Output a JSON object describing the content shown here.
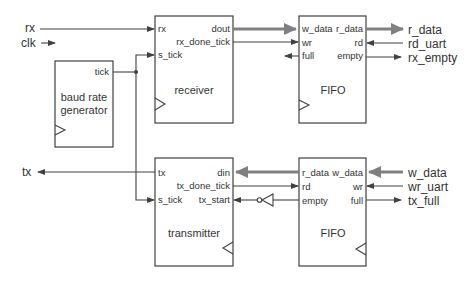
{
  "diagram": {
    "type": "block-diagram",
    "external_inputs": [
      "rx",
      "clk",
      "rd_uart",
      "w_data",
      "wr_uart"
    ],
    "external_outputs": [
      "r_data",
      "rx_empty",
      "tx",
      "tx_full"
    ],
    "blocks": {
      "baud": {
        "name": "baud rate generator",
        "line1": "baud rate",
        "line2": "generator",
        "ports": {
          "tick": "tick"
        }
      },
      "receiver": {
        "name": "receiver",
        "ports": {
          "rx": "rx",
          "s_tick": "s_tick",
          "dout": "dout",
          "rx_done_tick": "rx_done_tick"
        }
      },
      "fifo_rx": {
        "name": "FIFO",
        "ports": {
          "w_data": "w_data",
          "wr": "wr",
          "full": "full",
          "r_data": "r_data",
          "rd": "rd",
          "empty": "empty"
        }
      },
      "transmitter": {
        "name": "transmitter",
        "ports": {
          "tx": "tx",
          "s_tick": "s_tick",
          "din": "din",
          "tx_done_tick": "tx_done_tick",
          "tx_start": "tx_start"
        }
      },
      "fifo_tx": {
        "name": "FIFO",
        "ports": {
          "r_data": "r_data",
          "rd": "rd",
          "empty": "empty",
          "w_data": "w_data",
          "wr": "wr",
          "full": "full"
        }
      }
    },
    "signals": {
      "rx": "rx",
      "clk": "clk",
      "tx": "tx",
      "r_data": "r_data",
      "rd_uart": "rd_uart",
      "rx_empty": "rx_empty",
      "w_data": "w_data",
      "wr_uart": "wr_uart",
      "tx_full": "tx_full"
    },
    "connections": [
      {
        "from": "rx",
        "to": "receiver.rx"
      },
      {
        "from": "baud.tick",
        "to": "receiver.s_tick"
      },
      {
        "from": "baud.tick",
        "to": "transmitter.s_tick"
      },
      {
        "from": "receiver.dout",
        "to": "fifo_rx.w_data",
        "bus": true
      },
      {
        "from": "receiver.rx_done_tick",
        "to": "fifo_rx.wr"
      },
      {
        "from": "fifo_rx.full",
        "to": "(unconnected)"
      },
      {
        "from": "fifo_rx.r_data",
        "to": "r_data",
        "bus": true
      },
      {
        "from": "rd_uart",
        "to": "fifo_rx.rd"
      },
      {
        "from": "fifo_rx.empty",
        "to": "rx_empty"
      },
      {
        "from": "transmitter.tx",
        "to": "tx"
      },
      {
        "from": "fifo_tx.r_data",
        "to": "transmitter.din",
        "bus": true
      },
      {
        "from": "transmitter.tx_done_tick",
        "to": "fifo_tx.rd"
      },
      {
        "from": "fifo_tx.empty",
        "to": "transmitter.tx_start",
        "via": "inverter"
      },
      {
        "from": "w_data",
        "to": "fifo_tx.w_data",
        "bus": true
      },
      {
        "from": "wr_uart",
        "to": "fifo_tx.wr"
      },
      {
        "from": "fifo_tx.full",
        "to": "tx_full"
      }
    ]
  }
}
